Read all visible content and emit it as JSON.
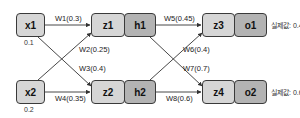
{
  "diagram": {
    "inputs": [
      {
        "id": "x1",
        "label": "x1",
        "value": "0.1"
      },
      {
        "id": "x2",
        "label": "x2",
        "value": "0.2"
      }
    ],
    "hidden": [
      {
        "z": "z1",
        "h": "h1"
      },
      {
        "z": "z2",
        "h": "h2"
      }
    ],
    "outputs": [
      {
        "z": "z3",
        "o": "o1",
        "actual": "실제값: 0.4"
      },
      {
        "z": "z4",
        "o": "o2",
        "actual": "실제값: 0.6"
      }
    ],
    "weights": {
      "w1": "W1(0.3)",
      "w2": "W2(0.25)",
      "w3": "W3(0.4)",
      "w4": "W4(0.35)",
      "w5": "W5(0.45)",
      "w6": "W6(0.4)",
      "w7": "W7(0.7)",
      "w8": "W8(0.6)"
    },
    "colors": {
      "node_light": "#d6d6d6",
      "node_dark": "#b3b3b3",
      "border": "#3a3a3a"
    }
  }
}
